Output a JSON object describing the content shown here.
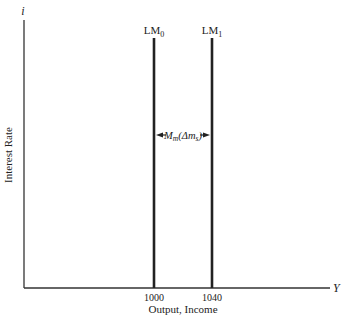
{
  "diagram": {
    "y_axis_symbol": "i",
    "y_axis_label": "Interest Rate",
    "x_axis_symbol": "Y",
    "x_axis_label": "Output, Income",
    "curves": [
      {
        "name": "LM",
        "subscript": "0",
        "x_value": 1000,
        "x_tick_label": "1000"
      },
      {
        "name": "LM",
        "subscript": "1",
        "x_value": 1040,
        "x_tick_label": "1040"
      }
    ],
    "shift_annotation": {
      "main": "M",
      "sub1": "m",
      "paren_open": "(Δm",
      "sub2": "s",
      "paren_close": ")"
    }
  }
}
